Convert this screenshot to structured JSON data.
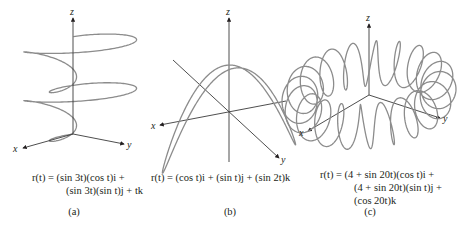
{
  "figure": {
    "panels": [
      {
        "id": "a",
        "label": "(a)",
        "axes": {
          "x": "x",
          "y": "y",
          "z": "z"
        },
        "caption_lines": [
          "r(t) = (sin 3t)(cos t)i +",
          "(sin 3t)(sin t)j + tk"
        ],
        "equation": {
          "x": "sin(3t)cos(t)",
          "y": "sin(3t)sin(t)",
          "z": "t"
        }
      },
      {
        "id": "b",
        "label": "(b)",
        "axes": {
          "x": "x",
          "y": "y",
          "z": "z"
        },
        "caption_lines": [
          "r(t) = (cos t)i + (sin t)j + (sin 2t)k"
        ],
        "equation": {
          "x": "cos(t)",
          "y": "sin(t)",
          "z": "sin(2t)"
        }
      },
      {
        "id": "c",
        "label": "(c)",
        "axes": {
          "x": "x",
          "y": "y",
          "z": "z"
        },
        "caption_lines": [
          "r(t) = (4 + sin 20t)(cos t)i +",
          "(4 + sin 20t)(sin t)j +",
          "(cos 20t)k"
        ],
        "equation": {
          "x": "(4+sin(20t))cos(t)",
          "y": "(4+sin(20t))sin(t)",
          "z": "cos(20t)"
        }
      }
    ]
  },
  "chart_data": [
    {
      "type": "line",
      "title": "(a) r(t) = (sin 3t)(cos t)i + (sin 3t)(sin t)j + tk",
      "kind": "3d-parametric-curve",
      "x": "sin(3t)cos(t)",
      "y": "sin(3t)sin(t)",
      "z": "t",
      "t_range": [
        0,
        6.28
      ],
      "axis_labels": [
        "x",
        "y",
        "z"
      ],
      "projection": {
        "origin": [
          73,
          134
        ],
        "ex": [
          -46,
          12
        ],
        "ey": [
          47,
          9
        ],
        "ez": [
          0,
          -15.5
        ]
      },
      "axis_ends": {
        "x": [
          23,
          148
        ],
        "y": [
          124,
          144
        ],
        "z": [
          73,
          18
        ]
      },
      "color": "#8c8c8c"
    },
    {
      "type": "line",
      "title": "(b) r(t) = (cos t)i + (sin t)j + (sin 2t)k",
      "kind": "3d-parametric-curve",
      "x": "cos(t)",
      "y": "sin(t)",
      "z": "sin(2t)",
      "t_range": [
        0,
        6.2832
      ],
      "axis_labels": [
        "x",
        "y",
        "z"
      ],
      "projection": {
        "origin": [
          229,
          113
        ],
        "ex": [
          -50,
          9
        ],
        "ey": [
          44,
          -11
        ],
        "ez": [
          0,
          -46
        ]
      },
      "axis_ends": {
        "x": [
          160,
          125
        ],
        "x_neg": [
          286,
          101
        ],
        "y": [
          279,
          158
        ],
        "y_neg": [
          173,
          60
        ],
        "z": [
          229,
          18
        ],
        "z_neg": [
          229,
          162
        ]
      },
      "color": "#8c8c8c"
    },
    {
      "type": "line",
      "title": "(c) r(t) = (4 + sin 20t)(cos t)i + (4 + sin 20t)(sin t)j + (cos 20t)k",
      "kind": "3d-parametric-curve",
      "x": "(4+sin(20t))cos(t)",
      "y": "(4+sin(20t))sin(t)",
      "z": "cos(20t)",
      "t_range": [
        0,
        6.2832
      ],
      "axis_labels": [
        "x",
        "y",
        "z"
      ],
      "projection": {
        "origin": [
          369,
          95
        ],
        "ex": [
          -11.8,
          6.8
        ],
        "ey": [
          12.8,
          4.2
        ],
        "ez": [
          0,
          -21
        ]
      },
      "axis_ends": {
        "x": [
          308,
          131
        ],
        "y": [
          440,
          118
        ],
        "z": [
          369,
          24
        ]
      },
      "color": "#8c8c8c"
    }
  ]
}
